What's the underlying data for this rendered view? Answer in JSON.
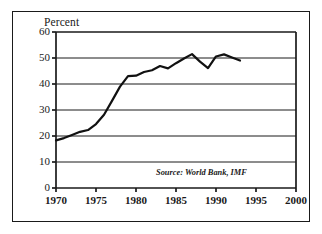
{
  "figure": {
    "y_axis_title": "Percent",
    "source_note": "Source: World Bank, IMF"
  },
  "chart_data": {
    "type": "line",
    "title": "",
    "subtitle": "",
    "xlabel": "",
    "ylabel": "Percent",
    "xlim": [
      1970,
      2000
    ],
    "ylim": [
      0,
      60
    ],
    "xticks": [
      1970,
      1975,
      1980,
      1985,
      1990,
      1995,
      2000
    ],
    "xtick_labels": [
      "1970",
      "1975",
      "1980",
      "1985",
      "1990",
      "1995",
      "2000"
    ],
    "yticks": [
      0,
      10,
      20,
      30,
      40,
      50,
      60
    ],
    "ytick_labels": [
      "0",
      "10",
      "20",
      "30",
      "40",
      "50",
      "60"
    ],
    "grid": "horizontal",
    "legend": "none",
    "line_color": "#111111",
    "annotations": [
      {
        "text": "Source: World Bank, IMF",
        "x": 1991.5,
        "y": 5.5
      }
    ],
    "series": [
      {
        "name": "Percent",
        "x": [
          1970,
          1971,
          1972,
          1973,
          1974,
          1975,
          1976,
          1977,
          1978,
          1979,
          1980,
          1981,
          1982,
          1983,
          1984,
          1985,
          1986,
          1987,
          1988,
          1989,
          1990,
          1991,
          1992,
          1993
        ],
        "values": [
          18.3,
          19.2,
          20.4,
          21.6,
          22.3,
          24.6,
          28.2,
          33.5,
          39.0,
          43.0,
          43.2,
          44.6,
          45.3,
          46.9,
          46.0,
          48.0,
          49.8,
          51.5,
          48.6,
          46.1,
          50.6,
          51.4,
          50.2,
          49.0
        ]
      }
    ]
  }
}
